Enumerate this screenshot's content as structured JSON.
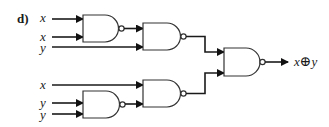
{
  "part_label": "d)",
  "inputs": [
    {
      "label": "x",
      "gate": "nand1"
    },
    {
      "label": "x",
      "gate": "nand1"
    },
    {
      "label": "y",
      "gate": "nand2"
    },
    {
      "label": "x",
      "gate": "nand4"
    },
    {
      "label": "y",
      "gate": "nand3"
    },
    {
      "label": "y",
      "gate": "nand3"
    }
  ],
  "gates": [
    {
      "id": "nand1",
      "type": "NAND"
    },
    {
      "id": "nand2",
      "type": "NAND"
    },
    {
      "id": "nand3",
      "type": "NAND"
    },
    {
      "id": "nand4",
      "type": "NAND"
    },
    {
      "id": "nand5",
      "type": "NAND"
    }
  ],
  "output": {
    "label_x": "x",
    "label_op": "⊕",
    "label_y": "y"
  }
}
